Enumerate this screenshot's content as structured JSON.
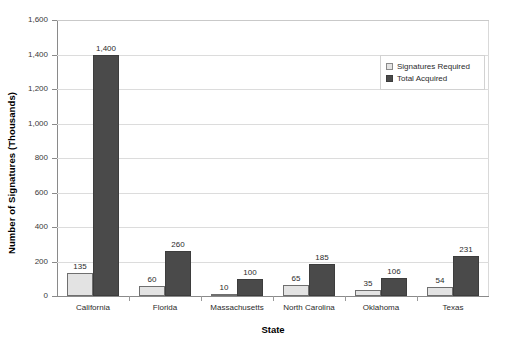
{
  "chart_data": {
    "type": "bar",
    "title": "",
    "xlabel": "State",
    "ylabel": "Number of Signatures (Thousands)",
    "ylim": [
      0,
      1600
    ],
    "ytick_step": 200,
    "ytick_labels": [
      "1,600",
      "1,400",
      "1,200",
      "1,000",
      "800",
      "600",
      "400",
      "200",
      "0"
    ],
    "ytick_values": [
      1600,
      1400,
      1200,
      1000,
      800,
      600,
      400,
      200,
      0
    ],
    "grid": true,
    "legend_position": "top-right",
    "categories": [
      "California",
      "Florida",
      "Massachusetts",
      "North Carolina",
      "Oklahoma",
      "Texas"
    ],
    "series": [
      {
        "name": "Signatures Required",
        "color": "#e3e3e3",
        "values": [
          135,
          60,
          10,
          65,
          35,
          54
        ],
        "labels": [
          "135",
          "60",
          "10",
          "65",
          "35",
          "54"
        ]
      },
      {
        "name": "Total Acquired",
        "color": "#4a4a4a",
        "values": [
          1400,
          260,
          100,
          185,
          106,
          231
        ],
        "labels": [
          "1,400",
          "260",
          "100",
          "185",
          "106",
          "231"
        ]
      }
    ]
  }
}
